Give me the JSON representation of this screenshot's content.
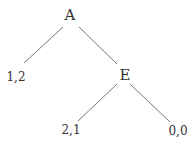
{
  "tree": {
    "root": {
      "label": "A"
    },
    "decision": {
      "label": "E"
    },
    "payoffs": [
      {
        "label": "1,2"
      },
      {
        "label": "2,1"
      },
      {
        "label": "0,0"
      }
    ]
  }
}
